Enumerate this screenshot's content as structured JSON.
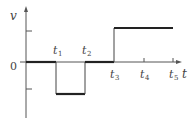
{
  "diagram": {
    "type": "piecewise-constant signal plot",
    "axes": {
      "y_label": "v",
      "x_label": "t",
      "origin_label": "0"
    },
    "time_markers": [
      {
        "base": "t",
        "sub": "1"
      },
      {
        "base": "t",
        "sub": "2"
      },
      {
        "base": "t",
        "sub": "3"
      },
      {
        "base": "t",
        "sub": "4"
      },
      {
        "base": "t",
        "sub": "5"
      }
    ],
    "segments": [
      {
        "from": "0",
        "to": "t1",
        "level": 0
      },
      {
        "from": "t1",
        "to": "t2",
        "level": -1
      },
      {
        "from": "t2",
        "to": "t3",
        "level": 0
      },
      {
        "from": "t3",
        "to": "t5",
        "level": 1
      }
    ],
    "colors": {
      "line": "#222222",
      "axis": "#555555",
      "background": "#ffffff"
    }
  }
}
